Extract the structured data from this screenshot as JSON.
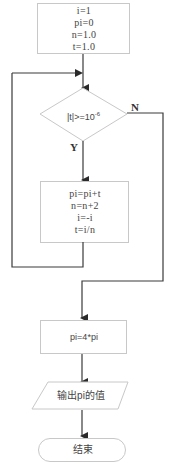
{
  "flowchart": {
    "init_box": {
      "lines": [
        "i=1",
        "pi=0",
        "n=1.0",
        "t=1.0"
      ]
    },
    "decision": {
      "text": "|t|>=10",
      "exponent": "-6",
      "yes_label": "Y",
      "no_label": "N"
    },
    "loop_box": {
      "lines": [
        "pi=pi+t",
        "n=n+2",
        "i=-i",
        "t=i/n"
      ]
    },
    "calc_box": {
      "text": "pi=4*pi"
    },
    "output_box": {
      "text": "输出pi的值"
    },
    "end_box": {
      "text": "结束"
    }
  },
  "colors": {
    "line": "#3a3a3a",
    "box_border": "#c8c8c8",
    "text": "#444444"
  }
}
